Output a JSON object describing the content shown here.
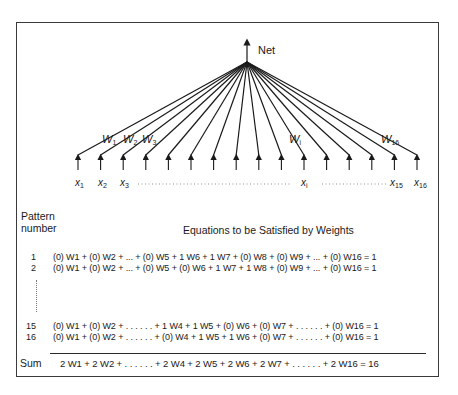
{
  "diagram": {
    "output_label": "Net",
    "weight_labels": {
      "w1": {
        "base": "W",
        "sub": "1"
      },
      "w2": {
        "base": "W",
        "sub": "2"
      },
      "w3": {
        "base": "W",
        "sub": "3"
      },
      "wi": {
        "base": "W",
        "sub": "i"
      },
      "w16": {
        "base": "W",
        "sub": "16"
      }
    },
    "input_labels": {
      "x1": {
        "base": "x",
        "sub": "1"
      },
      "x2": {
        "base": "x",
        "sub": "2"
      },
      "x3": {
        "base": "x",
        "sub": "3"
      },
      "xi": {
        "base": "x",
        "sub": "i"
      },
      "x15": {
        "base": "x",
        "sub": "15"
      },
      "x16": {
        "base": "x",
        "sub": "16"
      }
    },
    "input_count": 16
  },
  "table": {
    "header_col1_line1": "Pattern",
    "header_col1_line2": "number",
    "header_title": "Equations to be Satisfied by Weights",
    "rows": [
      {
        "number": "1",
        "equation": "(0) W1 + (0) W2 + ... + (0) W5 + 1 W6 + 1 W7 + (0) W8 + (0) W9 + ... + (0) W16 = 1"
      },
      {
        "number": "2",
        "equation": "(0) W1 + (0) W2 + ... + (0) W5 + (0) W6 + 1 W7 + 1 W8 + (0) W9 + ... + (0) W16 = 1"
      },
      {
        "number": "15",
        "equation": "(0) W1 + (0) W2 + . . . . . . + 1 W4 + 1 W5 + (0) W6 + (0) W7 + . . . . . . + (0) W16 = 1"
      },
      {
        "number": "16",
        "equation": "(0) W1 + (0) W2 + . . . . . . + (0) W4 + 1 W5 + 1 W6 + (0) W7 + . . . . . . + (0) W16 = 1"
      }
    ],
    "sum_label": "Sum",
    "sum_equation": "2 W1 + 2 W2 + . . . . . . + 2 W4 + 2 W5 + 2 W6 + 2 W7 + . . . . . . + 2 W16 = 16"
  }
}
